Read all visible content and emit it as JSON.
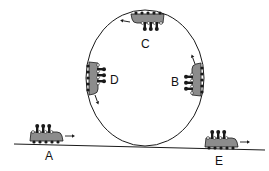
{
  "diagram": {
    "colors": {
      "line": "#1a1a1a",
      "car": "#8c8c8c",
      "rider": "#1a1a1a",
      "wheel_open": "#ffffff"
    },
    "loop": {
      "shape": "ellipse",
      "cx": 145,
      "cy": 78,
      "rx": 59,
      "ry": 68
    },
    "track": {
      "x1": 14,
      "y1": 144,
      "x2": 265,
      "y2": 150
    },
    "labels": {
      "A": "A",
      "B": "B",
      "C": "C",
      "D": "D",
      "E": "E"
    },
    "cars": [
      {
        "id": "A",
        "position": "ground, before loop",
        "direction": "right"
      },
      {
        "id": "B",
        "position": "right side of loop",
        "direction": "up"
      },
      {
        "id": "C",
        "position": "top of loop, inverted",
        "direction": "left"
      },
      {
        "id": "D",
        "position": "left side of loop",
        "direction": "down"
      },
      {
        "id": "E",
        "position": "ground, after loop",
        "direction": "right"
      }
    ]
  }
}
